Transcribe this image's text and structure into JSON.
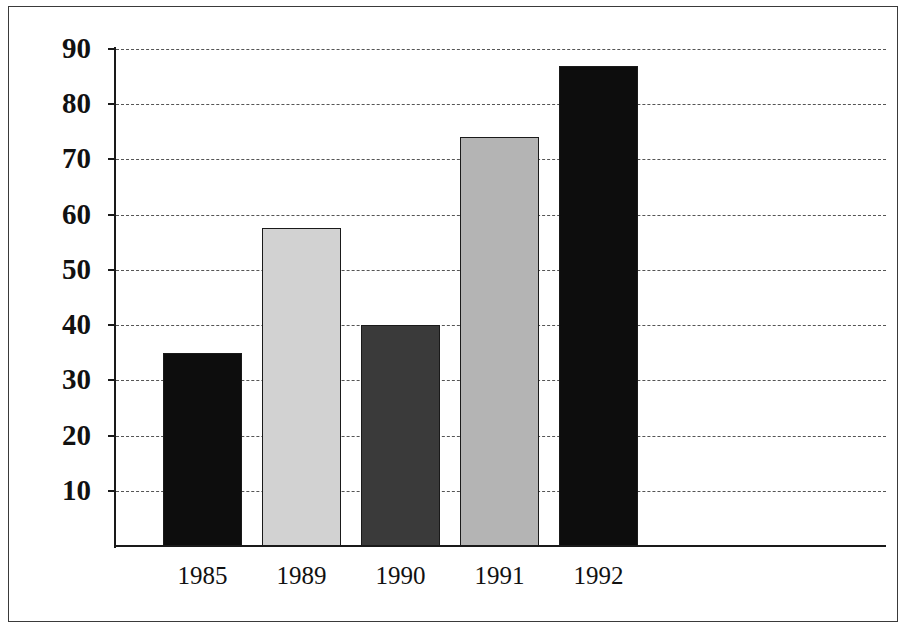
{
  "chart_data": {
    "type": "bar",
    "title": "",
    "subtitle": "",
    "xlabel": "",
    "ylabel": "",
    "categories": [
      "1985",
      "1989",
      "1990",
      "1991",
      "1992"
    ],
    "values": [
      35,
      57.5,
      40,
      74,
      87
    ],
    "series": [
      {
        "name": "",
        "values": [
          35,
          57.5,
          40,
          74,
          87
        ]
      }
    ],
    "bar_colors": [
      "#0d0d0d",
      "#d2d2d2",
      "#3a3a3a",
      "#b4b4b4",
      "#0d0d0d"
    ],
    "ylim": [
      0,
      90
    ],
    "ytick_values": [
      10,
      20,
      30,
      40,
      50,
      60,
      70,
      80,
      90
    ],
    "ytick_labels": [
      "10",
      "20",
      "30",
      "40",
      "50",
      "60",
      "70",
      "80",
      "90"
    ],
    "xtick_labels": [
      "1985",
      "1989",
      "1990",
      "1991",
      "1992"
    ],
    "grid": "horizontal-dashed",
    "legend": "none",
    "annotations": [],
    "bar_outline_color": "#1a1a1a",
    "axis_color": "#1a1a1a",
    "grid_color": "#555555",
    "background_color": "#ffffff",
    "frame_color": "#3a3a3a"
  }
}
